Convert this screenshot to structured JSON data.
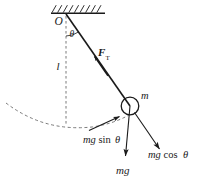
{
  "figure": {
    "domain": "Diagram",
    "width": 197,
    "height": 187,
    "background_color": "#ffffff",
    "ink_color": "#1a1a1a",
    "dash_color": "#6b6b6b"
  },
  "labels": {
    "pivot": "O",
    "angle": "θ",
    "length": "l",
    "tension_symbol": "F",
    "tension_subscript": "T",
    "mass": "m",
    "tangential_force": "mg sin θ",
    "radial_force": "mg cos θ",
    "weight": "mg"
  },
  "label_parts": {
    "tangential_prefix": "mg",
    "tangential_function": "sin",
    "tangential_angle": "θ",
    "radial_prefix": "mg",
    "radial_function": "cos",
    "radial_angle": "θ"
  },
  "geometry": {
    "pivot_point": {
      "x": 66,
      "y": 14
    },
    "bob_center": {
      "x": 130,
      "y": 106
    },
    "bob_radius": 9,
    "ceiling_bar": {
      "x1": 51,
      "y1": 13,
      "x2": 105,
      "y2": 13
    },
    "hatch_count": 9,
    "vertical_dashed_end": {
      "x": 66,
      "y": 125
    },
    "string_angle_degrees": 35
  },
  "vectors": [
    {
      "name": "tension",
      "label": "F_T",
      "from": {
        "x": 130,
        "y": 106
      },
      "to": {
        "x": 66,
        "y": 14
      },
      "direction": "up-left along string toward pivot",
      "arrow_at": {
        "x": 97,
        "y": 60
      }
    },
    {
      "name": "weight",
      "label": "mg",
      "from": {
        "x": 130,
        "y": 106
      },
      "to": {
        "x": 124,
        "y": 158
      },
      "direction": "straight down"
    },
    {
      "name": "tangential-component",
      "label": "mg sin θ",
      "from": {
        "x": 92,
        "y": 128
      },
      "to": {
        "x": 117,
        "y": 117
      },
      "direction": "up-right tangent to arc"
    },
    {
      "name": "radial-component",
      "label": "mg cos θ",
      "from": {
        "x": 134,
        "y": 115
      },
      "to": {
        "x": 158,
        "y": 148
      },
      "direction": "down-right radially outward"
    }
  ],
  "arc": {
    "name": "swing-path",
    "style": "dashed",
    "description": "dashed arc showing the pendulum swing path"
  }
}
